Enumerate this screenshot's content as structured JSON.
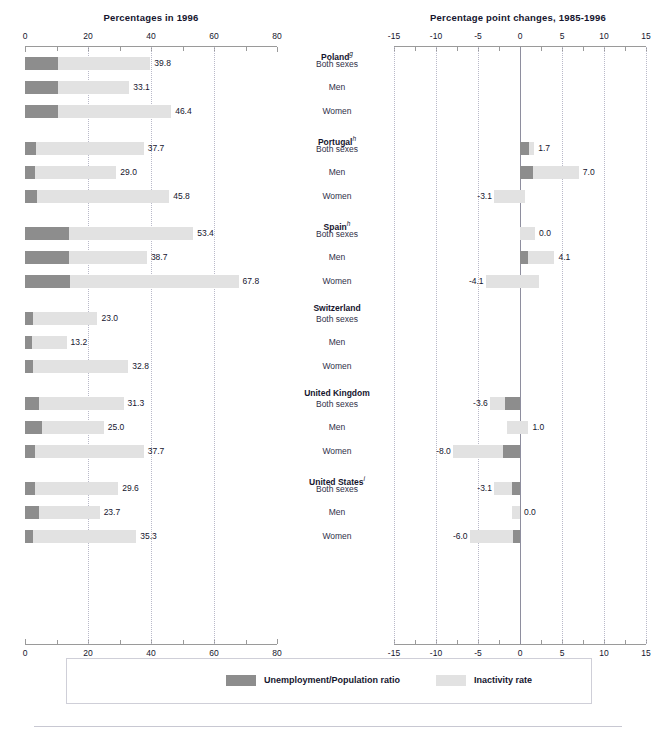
{
  "left_panel": {
    "title": "Percentages in 1996",
    "axis": {
      "min": 0,
      "max": 80,
      "ticks": [
        0,
        10,
        20,
        30,
        40,
        50,
        60,
        70,
        80
      ],
      "labeled_ticks": [
        0,
        20,
        40,
        60,
        80
      ],
      "gridlines": [
        20,
        40,
        60
      ]
    }
  },
  "right_panel": {
    "title": "Percentage point changes, 1985-1996",
    "axis": {
      "min": -15,
      "max": 15,
      "ticks": [
        -15,
        -12.5,
        -10,
        -7.5,
        -5,
        -2.5,
        0,
        2.5,
        5,
        7.5,
        10,
        12.5,
        15
      ],
      "labeled_ticks": [
        -15,
        -10,
        -5,
        0,
        5,
        10,
        15
      ],
      "gridlines": [
        -15,
        -10,
        -5,
        5,
        10,
        15
      ]
    }
  },
  "legend": {
    "items": [
      {
        "label": "Unemployment/Population ratio",
        "color": "#8d8d8d"
      },
      {
        "label": "Inactivity rate",
        "color": "#e2e2e2"
      }
    ]
  },
  "chart_data": {
    "type": "bar",
    "orientation": "horizontal",
    "stacked": true,
    "panels": [
      {
        "name": "Percentages in 1996",
        "xlabel": "",
        "xlim": [
          0,
          80
        ],
        "series": [
          {
            "name": "Unemployment/Population ratio",
            "color": "#8d8d8d"
          },
          {
            "name": "Inactivity rate",
            "color": "#e2e2e2"
          }
        ]
      },
      {
        "name": "Percentage point changes, 1985-1996",
        "xlabel": "",
        "xlim": [
          -15,
          15
        ],
        "series": [
          {
            "name": "Unemployment/Population ratio",
            "color": "#8d8d8d"
          },
          {
            "name": "Inactivity rate",
            "color": "#e2e2e2"
          }
        ]
      }
    ],
    "groups": [
      {
        "country": "Poland",
        "footnote": "g",
        "rows": [
          {
            "category": "Both sexes",
            "level_total": 39.8,
            "level_unemp": 10.4,
            "level_inact": 29.4,
            "change_total": null,
            "change_unemp": null,
            "change_inact": null
          },
          {
            "category": "Men",
            "level_total": 33.1,
            "level_unemp": 10.4,
            "level_inact": 22.7,
            "change_total": null,
            "change_unemp": null,
            "change_inact": null
          },
          {
            "category": "Women",
            "level_total": 46.4,
            "level_unemp": 10.4,
            "level_inact": 36.0,
            "change_total": null,
            "change_unemp": null,
            "change_inact": null
          }
        ]
      },
      {
        "country": "Portugal",
        "footnote": "h",
        "rows": [
          {
            "category": "Both sexes",
            "level_total": 37.7,
            "level_unemp": 3.6,
            "level_inact": 34.1,
            "change_total": 1.7,
            "change_unemp": 1.1,
            "change_inact": 0.6
          },
          {
            "category": "Men",
            "level_total": 29.0,
            "level_unemp": 3.2,
            "level_inact": 25.8,
            "change_total": 7.0,
            "change_unemp": 1.6,
            "change_inact": 5.4
          },
          {
            "category": "Women",
            "level_total": 45.8,
            "level_unemp": 3.9,
            "level_inact": 41.9,
            "change_total": -3.1,
            "change_unemp": 0.6,
            "change_inact": -3.7
          }
        ]
      },
      {
        "country": "Spain",
        "footnote": "h",
        "rows": [
          {
            "category": "Both sexes",
            "level_total": 53.4,
            "level_unemp": 14.1,
            "level_inact": 39.3,
            "change_total": 0.0,
            "change_unemp": 1.8,
            "change_inact": -1.8
          },
          {
            "category": "Men",
            "level_total": 38.7,
            "level_unemp": 14.1,
            "level_inact": 24.6,
            "change_total": 4.1,
            "change_unemp": 0.9,
            "change_inact": 3.2
          },
          {
            "category": "Women",
            "level_total": 67.8,
            "level_unemp": 14.3,
            "level_inact": 53.5,
            "change_total": -4.1,
            "change_unemp": 2.3,
            "change_inact": -6.4
          }
        ]
      },
      {
        "country": "Switzerland",
        "footnote": "",
        "rows": [
          {
            "category": "Both sexes",
            "level_total": 23.0,
            "level_unemp": 2.5,
            "level_inact": 20.5,
            "change_total": null,
            "change_unemp": null,
            "change_inact": null
          },
          {
            "category": "Men",
            "level_total": 13.2,
            "level_unemp": 2.3,
            "level_inact": 10.9,
            "change_total": null,
            "change_unemp": null,
            "change_inact": null
          },
          {
            "category": "Women",
            "level_total": 32.8,
            "level_unemp": 2.6,
            "level_inact": 30.2,
            "change_total": null,
            "change_unemp": null,
            "change_inact": null
          }
        ]
      },
      {
        "country": "United Kingdom",
        "footnote": "",
        "rows": [
          {
            "category": "Both sexes",
            "level_total": 31.3,
            "level_unemp": 4.4,
            "level_inact": 26.9,
            "change_total": -3.6,
            "change_unemp": -1.8,
            "change_inact": -1.8
          },
          {
            "category": "Men",
            "level_total": 25.0,
            "level_unemp": 5.4,
            "level_inact": 19.6,
            "change_total": 1.0,
            "change_unemp": -1.6,
            "change_inact": 2.6
          },
          {
            "category": "Women",
            "level_total": 37.7,
            "level_unemp": 3.3,
            "level_inact": 34.4,
            "change_total": -8.0,
            "change_unemp": -2.0,
            "change_inact": -6.0
          }
        ]
      },
      {
        "country": "United States",
        "footnote": "i",
        "rows": [
          {
            "category": "Both sexes",
            "level_total": 29.6,
            "level_unemp": 3.2,
            "level_inact": 26.4,
            "change_total": -3.1,
            "change_unemp": -0.9,
            "change_inact": -2.2
          },
          {
            "category": "Men",
            "level_total": 23.7,
            "level_unemp": 4.3,
            "level_inact": 19.4,
            "change_total": 0.0,
            "change_unemp": -0.9,
            "change_inact": 0.9
          },
          {
            "category": "Women",
            "level_total": 35.3,
            "level_unemp": 2.4,
            "level_inact": 32.9,
            "change_total": -6.0,
            "change_unemp": -0.8,
            "change_inact": -5.2
          }
        ]
      }
    ]
  }
}
